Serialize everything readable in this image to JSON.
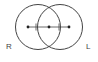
{
  "diagram": {
    "type": "two-overlapping-circles",
    "stroke_color": "#444444",
    "left_circle": {
      "cx": 38,
      "cy": 27,
      "r": 22.5
    },
    "right_circle": {
      "cx": 60,
      "cy": 27,
      "r": 22.5
    },
    "points": [
      {
        "x": 28,
        "y": 27
      },
      {
        "x": 49,
        "y": 27
      },
      {
        "x": 69,
        "y": 27
      }
    ],
    "ticks": [
      {
        "x": 36,
        "y": 27
      },
      {
        "x": 59,
        "y": 27
      }
    ],
    "labels": {
      "left": "R",
      "right": "L"
    }
  }
}
